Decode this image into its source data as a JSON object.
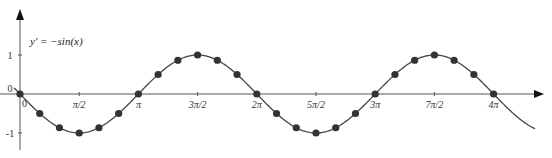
{
  "chart_data": {
    "type": "line",
    "title": "",
    "equation_label": "y' = −sin(x)",
    "xlabel": "",
    "ylabel": "",
    "x_ticks": [
      "0",
      "π/2",
      "π",
      "3π/2",
      "2π",
      "5π/2",
      "3π",
      "7π/2",
      "4π"
    ],
    "y_ticks": [
      "1",
      "0",
      "-1"
    ],
    "xlim": [
      -0.2,
      4.45
    ],
    "xlim_units": "multiples of pi",
    "ylim": [
      -1.2,
      1.5
    ],
    "grid": false,
    "series": [
      {
        "name": "y' = -sin(x)",
        "function": "-sin(x)",
        "style": "line",
        "x_range_pi": [
          -0.05,
          4.35
        ]
      },
      {
        "name": "sample points",
        "style": "markers",
        "x_pi": [
          0,
          0.1667,
          0.3333,
          0.5,
          0.6667,
          0.8333,
          1,
          1.1667,
          1.3333,
          1.5,
          1.6667,
          1.8333,
          2,
          2.1667,
          2.3333,
          2.5,
          2.6667,
          2.8333,
          3,
          3.1667,
          3.3333,
          3.5,
          3.6667,
          3.8333,
          4
        ],
        "y": [
          0,
          -0.5,
          -0.866,
          -1,
          -0.866,
          -0.5,
          0,
          0.5,
          0.866,
          1,
          0.866,
          0.5,
          0,
          -0.5,
          -0.866,
          -1,
          -0.866,
          -0.5,
          0,
          0.5,
          0.866,
          1,
          0.866,
          0.5,
          0
        ]
      }
    ],
    "colors": {
      "curve": "#444444",
      "points": "#333333",
      "axes": "#555555"
    }
  }
}
